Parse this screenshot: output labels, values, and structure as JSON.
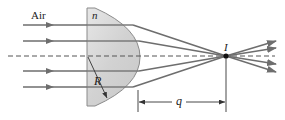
{
  "diagram": {
    "type": "optics-ray-diagram",
    "labels": {
      "medium": "Air",
      "index": "n",
      "radius": "R",
      "image_point": "I",
      "image_distance": "q"
    },
    "colors": {
      "ray": "#6e6e6e",
      "lens_fill": "#d9d9d9",
      "lens_stroke": "#8a8a8a",
      "axis": "#555555",
      "text": "#222222",
      "image_dot": "#111111"
    },
    "elements": {
      "incoming_rays": 4,
      "outgoing_rays": 4,
      "optical_axis": "dashed"
    }
  }
}
